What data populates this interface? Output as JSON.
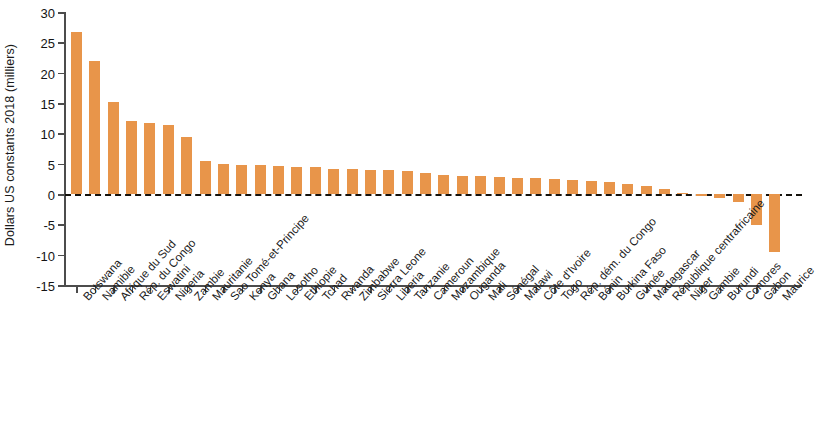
{
  "chart_data": {
    "type": "bar",
    "title": "",
    "subtitle": "",
    "xlabel": "",
    "ylabel": "Dollars US constants 2018 (milliers)",
    "ylim": [
      -15,
      30
    ],
    "yticks": [
      30,
      25,
      20,
      15,
      10,
      5,
      0,
      -5,
      -10,
      -15
    ],
    "ytick_labels": [
      "30",
      "25",
      "20",
      "15",
      "10",
      "5",
      "0",
      "-5",
      "-10",
      "-15"
    ],
    "grid": false,
    "legend": null,
    "zero_line": true,
    "bar_color": "#e8954a",
    "axis_color": "#4c4c4c",
    "categories": [
      "Botswana",
      "Namibie",
      "Afrique du Sud",
      "Rép. du Congo",
      "Eswatini",
      "Nigeria",
      "Zambie",
      "Mauritanie",
      "Sao Tomé-et-Principe",
      "Kenya",
      "Ghana",
      "Lesotho",
      "Ethiopie",
      "Tchad",
      "Rwanda",
      "Zimbabwe",
      "Sierra Leone",
      "Liberia",
      "Tanzanie",
      "Cameroun",
      "Mozambique",
      "Ouganda",
      "Mali",
      "Sénégal",
      "Malawi",
      "Côte d'Ivoire",
      "Togo",
      "Rép. dém. du Congo",
      "Bénin",
      "Burkina Faso",
      "Guinée",
      "Madagascar",
      "République centrafricaine",
      "Niger",
      "Gambie",
      "Burundi",
      "Comores",
      "Gabon",
      "Maurice"
    ],
    "values": [
      26.7,
      22.0,
      15.2,
      12.0,
      11.7,
      11.3,
      9.4,
      5.4,
      4.9,
      4.8,
      4.8,
      4.6,
      4.5,
      4.4,
      4.2,
      4.1,
      4.0,
      3.9,
      3.8,
      3.4,
      3.1,
      3.0,
      2.9,
      2.8,
      2.7,
      2.6,
      2.4,
      2.3,
      2.1,
      1.9,
      1.6,
      1.3,
      0.8,
      0.2,
      -0.3,
      -0.6,
      -1.4,
      -5.1,
      -9.5
    ]
  }
}
